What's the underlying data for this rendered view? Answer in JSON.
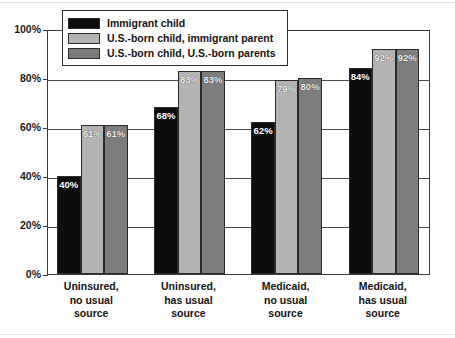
{
  "chart_data": {
    "type": "bar",
    "title": "",
    "xlabel": "",
    "ylabel": "",
    "ylim": [
      0,
      100
    ],
    "yticks": [
      "0%",
      "20%",
      "40%",
      "60%",
      "80%",
      "100%"
    ],
    "ytick_values": [
      0,
      20,
      40,
      60,
      80,
      100
    ],
    "grid": true,
    "legend_position": "top-left",
    "categories": [
      "Uninsured,\nno usual\nsource",
      "Uninsured,\nhas usual\nsource",
      "Medicaid,\nno usual\nsource",
      "Medicaid,\nhas usual\nsource"
    ],
    "category_lines": [
      [
        "Uninsured,",
        "no usual",
        "source"
      ],
      [
        "Uninsured,",
        "has usual",
        "source"
      ],
      [
        "Medicaid,",
        "no usual",
        "source"
      ],
      [
        "Medicaid,",
        "has usual",
        "source"
      ]
    ],
    "series": [
      {
        "name": "Immigrant child",
        "color": "#0d0d0d",
        "values": [
          40,
          68,
          62,
          84
        ],
        "labels": [
          "40%",
          "68%",
          "62%",
          "84%"
        ]
      },
      {
        "name": "U.S.-born child, immigrant parent",
        "color": "#b3b3b3",
        "values": [
          61,
          83,
          79,
          92
        ],
        "labels": [
          "61%",
          "83%",
          "79%",
          "92%"
        ]
      },
      {
        "name": "U.S.-born child, U.S.-born parents",
        "color": "#7d7d7d",
        "values": [
          61,
          83,
          80,
          92
        ],
        "labels": [
          "61%",
          "83%",
          "80%",
          "92%"
        ]
      }
    ]
  }
}
